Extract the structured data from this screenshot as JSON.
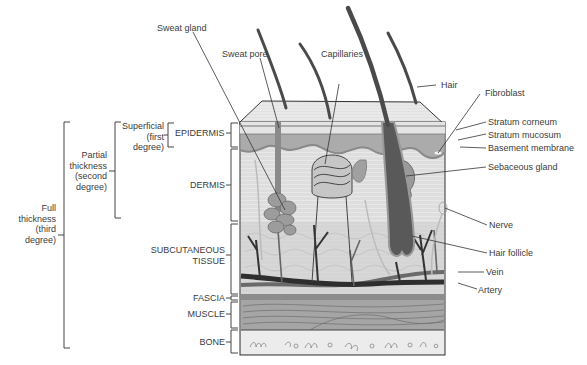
{
  "diagram": {
    "type": "anatomical cross-section",
    "colors": {
      "background": "#ffffff",
      "line": "#333333",
      "text": "#3b3b3b",
      "epidermis_top": "#e6e6e6",
      "stratum_mucosum": "#a9a9a9",
      "dermis": "#dcdcdc",
      "subcutaneous": "#d4d4d4",
      "hair": "#555555",
      "artery": "#2e2e2e",
      "vein": "#6a6a6a",
      "muscle": "#9a9a9a",
      "bone": "#ececec"
    }
  },
  "burn_depth": {
    "full": {
      "line1": "Full",
      "line2": "thickness",
      "line3": "(third",
      "line4": "degree)"
    },
    "partial": {
      "line1": "Partial",
      "line2": "thickness",
      "line3": "(second",
      "line4": "degree)"
    },
    "superficial": {
      "line1": "Superficial",
      "line2": "(first",
      "line3": "degree)"
    }
  },
  "layers": {
    "epidermis": "EPIDERMIS",
    "dermis": "DERMIS",
    "subcutaneous_1": "SUBCUTANEOUS",
    "subcutaneous_2": "TISSUE",
    "fascia": "FASCIA",
    "muscle": "MUSCLE",
    "bone": "BONE"
  },
  "structures": {
    "sweat_gland": "Sweat gland",
    "sweat_pore": "Sweat pore",
    "capillaries": "Capillaries",
    "hair": "Hair",
    "fibroblast": "Fibroblast",
    "stratum_corneum": "Stratum corneum",
    "stratum_mucosum": "Stratum mucosum",
    "basement_membrane": "Basement membrane",
    "sebaceous_gland": "Sebaceous gland",
    "nerve": "Nerve",
    "hair_follicle": "Hair follicle",
    "vein": "Vein",
    "artery": "Artery"
  }
}
